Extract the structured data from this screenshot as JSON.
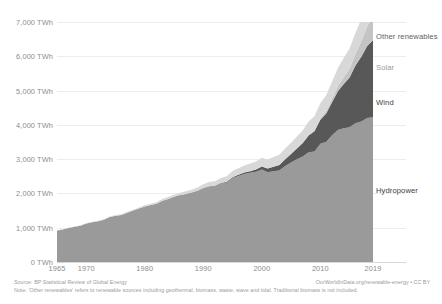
{
  "chart_data": {
    "type": "area",
    "stacked": true,
    "title": "",
    "xlabel": "",
    "ylabel": "",
    "unit": "TWh",
    "xlim": [
      1965,
      2019
    ],
    "ylim": [
      0,
      7000
    ],
    "grid": true,
    "legend_position": "inline-right",
    "y_ticks": [
      "0 TWh",
      "1,000 TWh",
      "2,000 TWh",
      "3,000 TWh",
      "4,000 TWh",
      "5,000 TWh",
      "6,000 TWh",
      "7,000 TWh"
    ],
    "y_tick_values": [
      0,
      1000,
      2000,
      3000,
      4000,
      5000,
      6000,
      7000
    ],
    "x_ticks": [
      "1965",
      "1970",
      "1980",
      "1990",
      "2000",
      "2010",
      "2019"
    ],
    "x_tick_values": [
      1965,
      1970,
      1980,
      1990,
      2000,
      2010,
      2019
    ],
    "x": [
      1965,
      1966,
      1967,
      1968,
      1969,
      1970,
      1971,
      1972,
      1973,
      1974,
      1975,
      1976,
      1977,
      1978,
      1979,
      1980,
      1981,
      1982,
      1983,
      1984,
      1985,
      1986,
      1987,
      1988,
      1989,
      1990,
      1991,
      1992,
      1993,
      1994,
      1995,
      1996,
      1997,
      1998,
      1999,
      2000,
      2001,
      2002,
      2003,
      2004,
      2005,
      2006,
      2007,
      2008,
      2009,
      2010,
      2011,
      2012,
      2013,
      2014,
      2015,
      2016,
      2017,
      2018,
      2019
    ],
    "series": [
      {
        "name": "Hydropower",
        "color": "#9a9a9a",
        "values": [
          920,
          950,
          990,
          1030,
          1060,
          1120,
          1160,
          1190,
          1230,
          1310,
          1350,
          1370,
          1440,
          1500,
          1560,
          1620,
          1660,
          1700,
          1790,
          1840,
          1900,
          1950,
          1980,
          2020,
          2070,
          2150,
          2200,
          2210,
          2290,
          2320,
          2450,
          2510,
          2570,
          2600,
          2630,
          2700,
          2620,
          2650,
          2670,
          2800,
          2900,
          3000,
          3080,
          3200,
          3220,
          3450,
          3500,
          3700,
          3850,
          3900,
          3930,
          4050,
          4100,
          4200,
          4220
        ]
      },
      {
        "name": "Wind",
        "color": "#585858",
        "values": [
          0,
          0,
          0,
          0,
          0,
          0,
          0,
          0,
          0,
          0,
          0,
          0,
          0,
          0,
          0,
          0,
          0,
          0,
          0,
          1,
          2,
          3,
          4,
          5,
          6,
          8,
          10,
          12,
          15,
          20,
          25,
          33,
          40,
          50,
          65,
          85,
          105,
          130,
          160,
          200,
          250,
          310,
          390,
          490,
          590,
          700,
          830,
          960,
          1130,
          1290,
          1450,
          1680,
          1890,
          2100,
          2250
        ]
      },
      {
        "name": "Solar",
        "color": "#c4c4c4",
        "values": [
          0,
          0,
          0,
          0,
          0,
          0,
          0,
          0,
          0,
          0,
          0,
          0,
          0,
          0,
          0,
          0,
          0,
          0,
          0,
          0,
          0,
          0,
          0,
          0,
          0,
          0,
          0,
          0,
          0,
          0,
          1,
          1,
          1,
          2,
          2,
          3,
          3,
          4,
          5,
          7,
          9,
          12,
          16,
          22,
          30,
          40,
          65,
          100,
          145,
          200,
          260,
          330,
          450,
          570,
          700
        ]
      },
      {
        "name": "Other renewables",
        "color": "#d8d8d8",
        "values": [
          5,
          6,
          7,
          8,
          9,
          10,
          11,
          12,
          14,
          16,
          18,
          20,
          23,
          26,
          30,
          34,
          38,
          43,
          48,
          54,
          60,
          68,
          76,
          85,
          95,
          110,
          120,
          132,
          145,
          160,
          175,
          190,
          205,
          220,
          235,
          250,
          262,
          275,
          290,
          305,
          320,
          340,
          360,
          385,
          410,
          440,
          470,
          500,
          530,
          560,
          590,
          620,
          650,
          680,
          700
        ]
      }
    ],
    "annotations": [
      {
        "label": "Other renewables",
        "x_px": 376,
        "y_px": 32
      },
      {
        "label": "Solar",
        "x_px": 376,
        "y_px": 63
      },
      {
        "label": "Wind",
        "x_px": 376,
        "y_px": 98
      },
      {
        "label": "Hydropower",
        "x_px": 376,
        "y_px": 186
      }
    ],
    "label_colors": {
      "other_renewables": "#5e5e5e",
      "solar": "#9a9a9a",
      "wind": "#3d3d3d",
      "hydropower": "#3d3d3d"
    }
  },
  "footer": {
    "source": "Source: BP Statistical Review of Global Energy",
    "attribution": "OurWorldInData.org/renewable-energy • CC BY",
    "note": "Note: 'Other renewables' refers to renewable sources including geothermal, biomass, waste, wave and tidal. Traditional biomass is not included."
  }
}
